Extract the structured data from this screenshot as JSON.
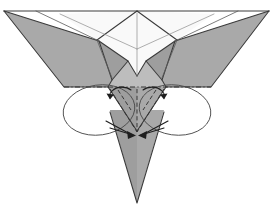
{
  "figure": {
    "kind": "origami-fold-diagram",
    "title": "Origami folding step diagram",
    "canvas": {
      "width": 273,
      "height": 210
    },
    "colors": {
      "background": "#ffffff",
      "paper_front": "#a9a9a9",
      "paper_back": "#f9f9f9",
      "paper_mid": "#9e9e9e",
      "paper_light": "#bdbdbd",
      "edge_stroke": "#3a3a3a",
      "crease_stroke": "#2e2e2e",
      "arrow_stroke": "#1e1e1e",
      "guide_stroke": "#4a4a4a"
    },
    "geometry": {
      "top_edge": {
        "left_x": 4,
        "right_x": 269,
        "y": 11
      },
      "apex_top_center": {
        "x": 137,
        "y": 11
      },
      "bottom_point": {
        "x": 137,
        "y": 203
      },
      "mid_fold_line": {
        "left_x": 64,
        "right_x": 211,
        "y": 87
      },
      "left_wing_tip": {
        "x": 4,
        "y": 11
      },
      "right_wing_tip": {
        "x": 269,
        "y": 11
      }
    },
    "shapes": {
      "left_wing": "M4,11 L94,37 L108,80 L86,87 L64,87 Z",
      "right_wing": "M269,11 L180,37 L166,80 L188,87 L211,87 Z",
      "back_panel_left": "M137,11 L106,47 L94,37 Z",
      "back_panel_right": "M137,11 L168,47 L180,37 Z",
      "center_lower": "M108,87 L137,131 L166,87 Z",
      "bottom_spike": "M110,120 L137,203 L164,120 Z"
    },
    "elements": {
      "left_oval": {
        "cx": 99,
        "cy": 110,
        "rx": 36,
        "ry": 25,
        "rotate": -8
      },
      "right_oval": {
        "cx": 175,
        "cy": 110,
        "rx": 36,
        "ry": 25,
        "rotate": 8
      },
      "mid_crease_label": "valley-fold-line",
      "arrow_count": 4
    },
    "arrows": [
      {
        "name": "upper-left-curl-arrow",
        "from": [
          128,
          92
        ],
        "to": [
          110,
          96
        ],
        "style": "curved",
        "direction": "left-down"
      },
      {
        "name": "upper-right-curl-arrow",
        "from": [
          146,
          92
        ],
        "to": [
          164,
          96
        ],
        "style": "curved",
        "direction": "right-down"
      },
      {
        "name": "lower-left-tuck-arrow",
        "from": [
          108,
          122
        ],
        "to": [
          133,
          136
        ],
        "style": "straight",
        "direction": "down-right"
      },
      {
        "name": "lower-right-tuck-arrow",
        "from": [
          166,
          122
        ],
        "to": [
          141,
          136
        ],
        "style": "straight",
        "direction": "down-left"
      }
    ],
    "creases": [
      {
        "name": "mid-horizontal-valley",
        "points": "64,87 211,87",
        "type": "dash-dot"
      },
      {
        "name": "left-diagonal-dash",
        "points": "110,89 137,131",
        "type": "dashed"
      },
      {
        "name": "right-diagonal-dash",
        "points": "164,89 137,131",
        "type": "dashed"
      },
      {
        "name": "center-vertical-dash",
        "points": "137,89 137,131",
        "type": "dashed"
      }
    ]
  }
}
